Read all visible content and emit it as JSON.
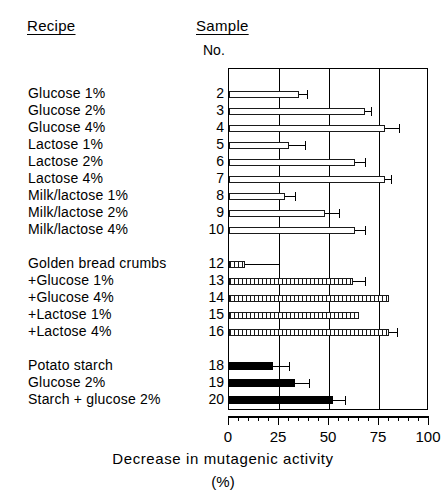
{
  "headers": {
    "recipe": "Recipe",
    "sample": "Sample",
    "number": "No."
  },
  "axis": {
    "title": "Decrease in mutagenic activity",
    "unit": "(%)",
    "ticks": [
      "0",
      "25",
      "50",
      "75",
      "100"
    ]
  },
  "chart_data": {
    "type": "bar",
    "orientation": "horizontal",
    "title": "",
    "xlabel": "Decrease in mutagenic activity (%)",
    "ylabel": "Sample No.",
    "xlim": [
      0,
      100
    ],
    "xticks": [
      0,
      25,
      50,
      75,
      100
    ],
    "xminor_tick_step": 5,
    "grid": "vertical gridlines at 25, 50, 75",
    "legend": "none",
    "bar_styles": {
      "open": "white bar with thin black outline",
      "hatch": "hatched / dashed-fill bar with black outline",
      "solid": "solid black bar"
    },
    "groups": [
      {
        "name": "Sugars",
        "style": "open",
        "rows": [
          {
            "sample": "2",
            "recipe": "Glucose  1%",
            "value": 35,
            "error_high": 39
          },
          {
            "sample": "3",
            "recipe": "Glucose  2%",
            "value": 68,
            "error_high": 71
          },
          {
            "sample": "4",
            "recipe": "Glucose  4%",
            "value": 78,
            "error_high": 85
          },
          {
            "sample": "5",
            "recipe": "Lactose  1%",
            "value": 30,
            "error_high": 38
          },
          {
            "sample": "6",
            "recipe": "Lactose  2%",
            "value": 63,
            "error_high": 68
          },
          {
            "sample": "7",
            "recipe": "Lactose  4%",
            "value": 78,
            "error_high": 81
          },
          {
            "sample": "8",
            "recipe": "Milk/lactose  1%",
            "value": 28,
            "error_high": 33
          },
          {
            "sample": "9",
            "recipe": "Milk/lactose  2%",
            "value": 48,
            "error_high": 55
          },
          {
            "sample": "10",
            "recipe": "Milk/lactose  4%",
            "value": 63,
            "error_high": 68
          }
        ]
      },
      {
        "name": "Golden bread crumbs",
        "style": "hatch",
        "rows": [
          {
            "sample": "12",
            "recipe": "Golden bread crumbs",
            "value": 8,
            "error_high": 25
          },
          {
            "sample": "13",
            "recipe": "+Glucose  1%",
            "value": 62,
            "error_high": 68
          },
          {
            "sample": "14",
            "recipe": "+Glucose  4%",
            "value": 80,
            "error_high": 80
          },
          {
            "sample": "15",
            "recipe": "+Lactose  1%",
            "value": 65,
            "error_high": 65
          },
          {
            "sample": "16",
            "recipe": "+Lactose  4%",
            "value": 80,
            "error_high": 84
          }
        ]
      },
      {
        "name": "Potato starch",
        "style": "solid",
        "rows": [
          {
            "sample": "18",
            "recipe": "Potato starch",
            "value": 22,
            "error_high": 30
          },
          {
            "sample": "19",
            "recipe": "Glucose 2%",
            "value": 33,
            "error_high": 40
          },
          {
            "sample": "20",
            "recipe": "Starch + glucose  2%",
            "value": 52,
            "error_high": 58
          }
        ]
      }
    ]
  }
}
